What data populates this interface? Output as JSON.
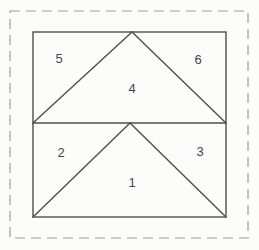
{
  "canvas": {
    "width": 259,
    "height": 250,
    "background": "#fcfcfa"
  },
  "diagram": {
    "stroke_color": "#4f4f4f",
    "stroke_width": 1.4,
    "dash_color": "#9c9c9c",
    "dash_width": 1.2,
    "dash_pattern": "10 6",
    "label_color": "#474747",
    "label_font_size": 13,
    "cut_border": {
      "x": 10,
      "y": 11,
      "width": 238,
      "height": 227
    },
    "block_outline": {
      "x": 33,
      "y": 32,
      "width": 193,
      "height": 185
    },
    "seam_lines": [
      {
        "name": "center-horizontal-seam",
        "x1": 33,
        "y1": 123,
        "x2": 226,
        "y2": 123
      },
      {
        "name": "top-goose-left-seam",
        "x1": 33,
        "y1": 123,
        "x2": 132,
        "y2": 32
      },
      {
        "name": "top-goose-right-seam",
        "x1": 132,
        "y1": 32,
        "x2": 226,
        "y2": 123
      },
      {
        "name": "bottom-goose-left-seam",
        "x1": 33,
        "y1": 217,
        "x2": 130,
        "y2": 123
      },
      {
        "name": "bottom-goose-right-seam",
        "x1": 130,
        "y1": 123,
        "x2": 226,
        "y2": 217
      }
    ],
    "piece_labels": [
      {
        "text": "1",
        "x": 132,
        "y": 182
      },
      {
        "text": "2",
        "x": 61,
        "y": 152
      },
      {
        "text": "3",
        "x": 200,
        "y": 151
      },
      {
        "text": "4",
        "x": 132,
        "y": 88
      },
      {
        "text": "5",
        "x": 59,
        "y": 58
      },
      {
        "text": "6",
        "x": 198,
        "y": 59
      }
    ]
  }
}
